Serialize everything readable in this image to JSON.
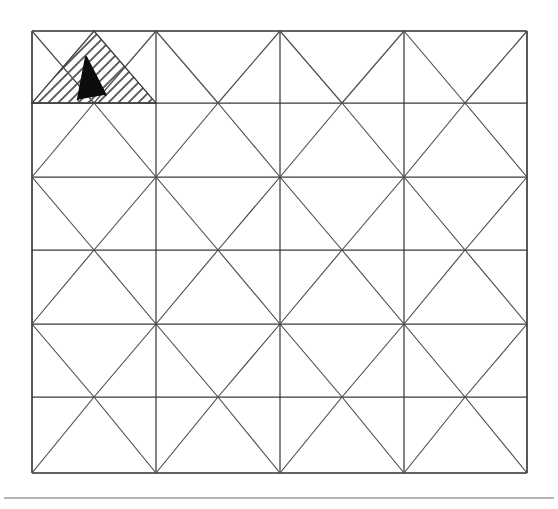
{
  "figure": {
    "background_color": "#ffffff",
    "line_color": "#3a3a3a",
    "hatch_color": "#5a5a5a",
    "label_color": "#0d0d0d",
    "footer_rule_color": "#9a9a9a"
  },
  "grid": {
    "name": "diagonal-lattice-grid",
    "columns": 4,
    "rows": 6,
    "x_left": 32,
    "x_right": 527,
    "y_top": 31,
    "column_edges": [
      32,
      156,
      280,
      404,
      527
    ],
    "row_edges": [
      31,
      103,
      177,
      250,
      324,
      397,
      473
    ],
    "cell_width": 124,
    "cell_height": 73.7,
    "diagonals": "X-cross in every cell"
  },
  "region": {
    "name": "hatched-triangle",
    "label": "A",
    "shape": "triangle",
    "apex_x": 94,
    "apex_y": 31,
    "base_left_x": 32,
    "base_right_x": 156,
    "base_y": 103,
    "hatch_direction": "lower-left to upper-right",
    "hatch_spacing_px": 7,
    "label_x": 88,
    "label_y": 78,
    "label_rotation_deg": -8
  },
  "footer": {
    "name": "footer-separator",
    "y": 498,
    "x_start": 4,
    "x_end": 554
  }
}
